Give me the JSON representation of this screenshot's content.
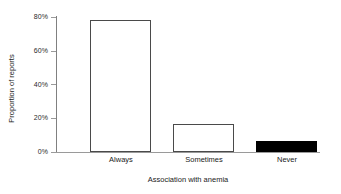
{
  "chart_data": {
    "type": "bar",
    "title": "",
    "categories": [
      "Always",
      "Sometimes",
      "Never"
    ],
    "values": [
      78,
      16.5,
      6.5
    ],
    "value_labels": [
      "78%",
      "16.5%",
      "6.5%"
    ],
    "series": [
      {
        "name": "Proportion of reports",
        "values": [
          78,
          16.5,
          6.5
        ]
      }
    ],
    "xlabel": "Association with anemia",
    "ylabel": "Proportion of reports",
    "ylim": [
      0,
      80
    ],
    "yticks": [
      0,
      20,
      40,
      60,
      80
    ],
    "ytick_labels": [
      "0%",
      "20%",
      "40%",
      "60%",
      "80%"
    ],
    "xtick_labels": [
      "Always",
      "Sometimes",
      "Never"
    ],
    "grid": false,
    "legend": null,
    "legend_position": "none",
    "bar_styles": [
      "outline",
      "outline",
      "filled"
    ],
    "colors": {
      "bar_outline_fill": "#ffffff",
      "bar_outline_stroke": "#4a4a4a",
      "bar_filled": "#000000",
      "axis": "#9a9a9a",
      "text": "#1a1a1a",
      "background": "#ffffff"
    }
  },
  "axes": {
    "y": {
      "title": "Proportion of reports",
      "ticks": [
        {
          "label": "0%",
          "value": 0
        },
        {
          "label": "20%",
          "value": 20
        },
        {
          "label": "40%",
          "value": 40
        },
        {
          "label": "60%",
          "value": 60
        },
        {
          "label": "80%",
          "value": 80
        }
      ]
    },
    "x": {
      "title": "Association with anemia",
      "ticks": [
        {
          "label": "Always"
        },
        {
          "label": "Sometimes"
        },
        {
          "label": "Never"
        }
      ]
    }
  }
}
